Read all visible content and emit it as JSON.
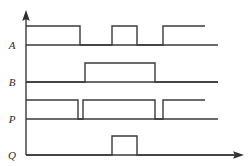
{
  "figure": {
    "background_color": "#ffffff",
    "line_color": "#3a3a3a",
    "label_color": "#2b2b2b",
    "width": 252,
    "height": 166
  },
  "axes": {
    "vertical_axis_name": "vertical-axis",
    "horizontal_axis_name": "time-axis",
    "origin_x": 26,
    "axis_top_y": 14,
    "axis_bottom_y": 155,
    "axis_right_x": 242,
    "arrow_up": "arrow-up",
    "arrow_right": "arrow-right"
  },
  "chart_data": {
    "type": "line",
    "xlabel": "",
    "ylabel": "",
    "grid": false,
    "legend": "none",
    "xlim": [
      26,
      242
    ],
    "series": [
      {
        "name": "A",
        "label": "A",
        "baseline_y": 45,
        "high_y": 26,
        "end_x": 205,
        "transitions": [
          {
            "x": 26,
            "level": 1
          },
          {
            "x": 80,
            "level": 0
          },
          {
            "x": 112,
            "level": 1
          },
          {
            "x": 137,
            "level": 0
          },
          {
            "x": 163,
            "level": 1
          },
          {
            "x": 205,
            "level": 1
          }
        ],
        "pulses": [
          {
            "start": 26,
            "end": 80
          },
          {
            "start": 112,
            "end": 137
          },
          {
            "start": 163,
            "end": 205
          }
        ]
      },
      {
        "name": "B",
        "label": "B",
        "baseline_y": 82,
        "high_y": 63,
        "end_x": 218,
        "transitions": [
          {
            "x": 26,
            "level": 0
          },
          {
            "x": 85,
            "level": 1
          },
          {
            "x": 155,
            "level": 0
          },
          {
            "x": 218,
            "level": 0
          }
        ],
        "pulses": [
          {
            "start": 85,
            "end": 155
          }
        ]
      },
      {
        "name": "P",
        "label": "P",
        "baseline_y": 119,
        "high_y": 100,
        "end_x": 205,
        "transitions": [
          {
            "x": 26,
            "level": 1
          },
          {
            "x": 78,
            "level": 0
          },
          {
            "x": 83,
            "level": 1
          },
          {
            "x": 155,
            "level": 0
          },
          {
            "x": 163,
            "level": 1
          },
          {
            "x": 205,
            "level": 1
          }
        ],
        "pulses": [
          {
            "start": 26,
            "end": 78
          },
          {
            "start": 83,
            "end": 155
          },
          {
            "start": 163,
            "end": 205
          }
        ]
      },
      {
        "name": "Q",
        "label": "Q",
        "baseline_y": 155,
        "high_y": 136,
        "end_x": 238,
        "transitions": [
          {
            "x": 26,
            "level": 0
          },
          {
            "x": 112,
            "level": 1
          },
          {
            "x": 137,
            "level": 0
          },
          {
            "x": 238,
            "level": 0
          }
        ],
        "pulses": [
          {
            "start": 112,
            "end": 137
          }
        ]
      }
    ]
  },
  "labels": {
    "a": "A",
    "b": "B",
    "p": "P",
    "q": "Q",
    "a_pos": {
      "x": 12,
      "y": 49
    },
    "b_pos": {
      "x": 12,
      "y": 86
    },
    "p_pos": {
      "x": 12,
      "y": 123
    },
    "q_pos": {
      "x": 12,
      "y": 159
    }
  }
}
